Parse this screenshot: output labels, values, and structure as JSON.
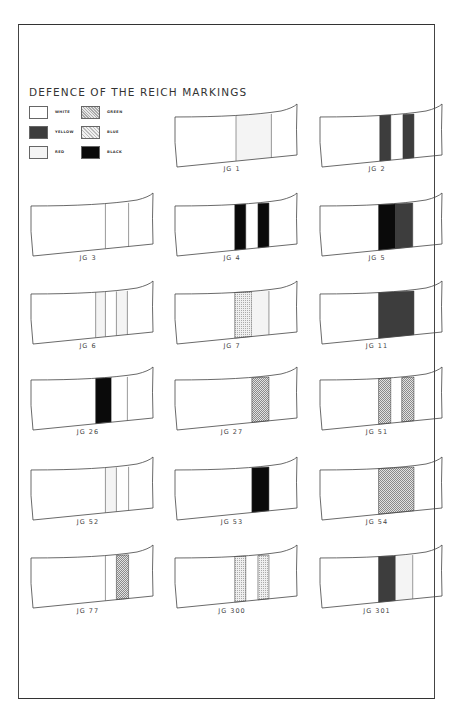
{
  "title": "DEFENCE OF THE REICH MARKINGS",
  "legend": {
    "items": [
      {
        "label": "WHITE",
        "pattern": "white"
      },
      {
        "label": "YELLOW",
        "pattern": "yellow"
      },
      {
        "label": "RED",
        "pattern": "red"
      },
      {
        "label": "GREEN",
        "pattern": "green"
      },
      {
        "label": "BLUE",
        "pattern": "blue"
      },
      {
        "label": "BLACK",
        "pattern": "black"
      }
    ]
  },
  "patterns": {
    "white": "#ffffff",
    "yellow": "#3d3d3d",
    "red": "#f4f4f4",
    "green": "url-dots-dense",
    "blue": "url-dots-light",
    "black": "#0a0a0a"
  },
  "units": [
    {
      "label": "JG 1",
      "bands": [
        {
          "start": 0.5,
          "end": 0.79,
          "color": "red"
        }
      ],
      "extra_lines": [
        0.5,
        0.79
      ]
    },
    {
      "label": "JG 2",
      "bands": [
        {
          "start": 0.49,
          "end": 0.58,
          "color": "yellow"
        },
        {
          "start": 0.68,
          "end": 0.77,
          "color": "yellow"
        }
      ],
      "extra_lines": []
    },
    {
      "label": "JG 3",
      "bands": [
        {
          "start": 0.61,
          "end": 0.8,
          "color": "white"
        }
      ],
      "extra_lines": [
        0.61,
        0.8
      ]
    },
    {
      "label": "JG 4",
      "bands": [
        {
          "start": 0.49,
          "end": 0.58,
          "color": "black"
        },
        {
          "start": 0.68,
          "end": 0.77,
          "color": "black"
        }
      ],
      "extra_lines": []
    },
    {
      "label": "JG 5",
      "bands": [
        {
          "start": 0.48,
          "end": 0.62,
          "color": "black"
        },
        {
          "start": 0.62,
          "end": 0.76,
          "color": "yellow"
        }
      ],
      "extra_lines": []
    },
    {
      "label": "JG 6",
      "bands": [
        {
          "start": 0.53,
          "end": 0.61,
          "color": "red"
        },
        {
          "start": 0.7,
          "end": 0.79,
          "color": "red"
        }
      ],
      "extra_lines": [
        0.53,
        0.61,
        0.7,
        0.79
      ]
    },
    {
      "label": "JG 7",
      "bands": [
        {
          "start": 0.49,
          "end": 0.63,
          "color": "blue"
        },
        {
          "start": 0.63,
          "end": 0.77,
          "color": "red"
        }
      ],
      "extra_lines": [
        0.77
      ]
    },
    {
      "label": "JG 11",
      "bands": [
        {
          "start": 0.48,
          "end": 0.77,
          "color": "yellow"
        }
      ],
      "extra_lines": []
    },
    {
      "label": "JG 26",
      "bands": [
        {
          "start": 0.53,
          "end": 0.66,
          "color": "black"
        },
        {
          "start": 0.66,
          "end": 0.79,
          "color": "white"
        }
      ],
      "extra_lines": [
        0.79
      ]
    },
    {
      "label": "JG 27",
      "bands": [
        {
          "start": 0.63,
          "end": 0.77,
          "color": "green"
        }
      ],
      "extra_lines": []
    },
    {
      "label": "JG 51",
      "bands": [
        {
          "start": 0.48,
          "end": 0.58,
          "color": "green"
        },
        {
          "start": 0.67,
          "end": 0.77,
          "color": "green"
        }
      ],
      "extra_lines": []
    },
    {
      "label": "JG 52",
      "bands": [
        {
          "start": 0.61,
          "end": 0.7,
          "color": "red"
        },
        {
          "start": 0.7,
          "end": 0.8,
          "color": "white"
        }
      ],
      "extra_lines": [
        0.61,
        0.7,
        0.8
      ]
    },
    {
      "label": "JG 53",
      "bands": [
        {
          "start": 0.63,
          "end": 0.77,
          "color": "black"
        }
      ],
      "extra_lines": []
    },
    {
      "label": "JG 54",
      "bands": [
        {
          "start": 0.48,
          "end": 0.77,
          "color": "green"
        }
      ],
      "extra_lines": []
    },
    {
      "label": "JG 77",
      "bands": [
        {
          "start": 0.61,
          "end": 0.7,
          "color": "white"
        },
        {
          "start": 0.7,
          "end": 0.8,
          "color": "green"
        }
      ],
      "extra_lines": [
        0.61
      ]
    },
    {
      "label": "JG 300",
      "bands": [
        {
          "start": 0.49,
          "end": 0.58,
          "color": "blue"
        },
        {
          "start": 0.68,
          "end": 0.77,
          "color": "blue"
        }
      ],
      "extra_lines": []
    },
    {
      "label": "JG 301",
      "bands": [
        {
          "start": 0.48,
          "end": 0.62,
          "color": "yellow"
        },
        {
          "start": 0.62,
          "end": 0.76,
          "color": "red"
        }
      ],
      "extra_lines": [
        0.76
      ]
    }
  ]
}
